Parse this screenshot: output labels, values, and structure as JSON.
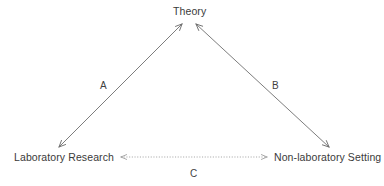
{
  "diagram": {
    "background_color": "#ffffff",
    "stroke_color": "#6e6e6e",
    "dotted_stroke_color": "#9a9a9a",
    "text_color": "#3a3a3a",
    "nodes": [
      {
        "id": "theory",
        "label": "Theory"
      },
      {
        "id": "laboratory_research",
        "label": "Laboratory Research"
      },
      {
        "id": "non_laboratory_setting",
        "label": "Non-laboratory Setting"
      }
    ],
    "edges": [
      {
        "id": "edge_a",
        "label": "A",
        "from": "laboratory_research",
        "to": "theory",
        "style": "solid",
        "arrows": "both"
      },
      {
        "id": "edge_b",
        "label": "B",
        "from": "theory",
        "to": "non_laboratory_setting",
        "style": "solid",
        "arrows": "both"
      },
      {
        "id": "edge_c",
        "label": "C",
        "from": "laboratory_research",
        "to": "non_laboratory_setting",
        "style": "dotted",
        "arrows": "both"
      }
    ]
  }
}
